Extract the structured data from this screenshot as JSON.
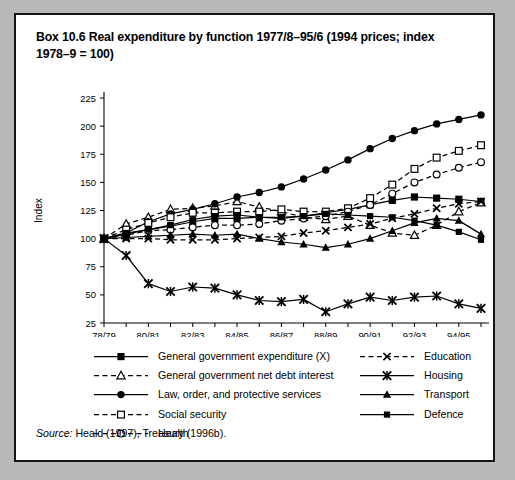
{
  "box": {
    "title": "Box 10.6  Real expenditure by function 1977/8–95/6 (1994 prices; index 1978–9 = 100)",
    "source_prefix": "Source:",
    "source_text": " Heald (1997), Treasury (1996b)."
  },
  "chart_data": {
    "type": "line",
    "title": "Real expenditure by function 1977/8–95/6 (1994 prices; index 1978–9 = 100)",
    "xlabel": "",
    "ylabel": "Index",
    "ylim": [
      25,
      225
    ],
    "yticks": [
      25,
      50,
      75,
      100,
      125,
      150,
      175,
      200,
      225
    ],
    "grid": false,
    "legend_position": "below",
    "x": [
      "78/79",
      "79/80",
      "80/81",
      "81/82",
      "82/83",
      "83/84",
      "84/85",
      "85/86",
      "86/87",
      "87/88",
      "88/89",
      "89/90",
      "90/91",
      "91/92",
      "92/93",
      "93/94",
      "94/95",
      "95/96"
    ],
    "xtick_labels": [
      "78/79",
      "80/81",
      "82/83",
      "84/85",
      "86/87",
      "88/89",
      "90/91",
      "92/93",
      "94/95"
    ],
    "xtick_indices": [
      0,
      2,
      4,
      6,
      8,
      10,
      12,
      14,
      16
    ],
    "series": [
      {
        "name": "General government expenditure (X)",
        "marker": "filled-square",
        "line": "solid",
        "values": [
          100,
          104,
          108,
          111,
          115,
          118,
          118,
          119,
          118,
          120,
          123,
          126,
          130,
          134,
          137,
          136,
          135,
          133
        ]
      },
      {
        "name": "General government net debt interest",
        "marker": "open-triangle",
        "line": "dashed",
        "values": [
          100,
          113,
          119,
          126,
          127,
          129,
          133,
          128,
          124,
          119,
          117,
          120,
          112,
          105,
          103,
          112,
          124,
          132
        ]
      },
      {
        "name": "Law, order, and protective services",
        "marker": "filled-circle",
        "line": "solid",
        "values": [
          100,
          105,
          115,
          122,
          126,
          131,
          137,
          141,
          146,
          153,
          161,
          170,
          180,
          189,
          196,
          202,
          206,
          210
        ]
      },
      {
        "name": "Social security",
        "marker": "open-square",
        "line": "dashed",
        "values": [
          100,
          108,
          114,
          119,
          123,
          123,
          124,
          124,
          126,
          124,
          124,
          127,
          136,
          148,
          162,
          172,
          178,
          183
        ]
      },
      {
        "name": "Health",
        "marker": "open-circle",
        "line": "dashed",
        "values": [
          100,
          103,
          107,
          108,
          110,
          112,
          112,
          113,
          116,
          118,
          120,
          124,
          130,
          140,
          150,
          157,
          163,
          168
        ]
      },
      {
        "name": "Education",
        "marker": "cross-x",
        "line": "dashed",
        "values": [
          100,
          100,
          100,
          99,
          99,
          99,
          100,
          101,
          102,
          105,
          107,
          110,
          113,
          118,
          122,
          127,
          131,
          133
        ]
      },
      {
        "name": "Housing",
        "marker": "star-x",
        "line": "solid",
        "values": [
          100,
          85,
          60,
          53,
          57,
          56,
          50,
          45,
          44,
          46,
          35,
          42,
          48,
          45,
          48,
          49,
          42,
          38
        ]
      },
      {
        "name": "Transport",
        "marker": "filled-triangle",
        "line": "solid",
        "values": [
          100,
          101,
          102,
          103,
          104,
          103,
          104,
          100,
          97,
          95,
          92,
          95,
          100,
          107,
          114,
          118,
          116,
          104
        ]
      },
      {
        "name": "Defence",
        "marker": "filled-square-sm",
        "line": "solid",
        "values": [
          100,
          105,
          108,
          112,
          117,
          120,
          121,
          119,
          119,
          120,
          122,
          121,
          120,
          119,
          116,
          112,
          106,
          99
        ]
      }
    ]
  },
  "legend": {
    "left_items": [
      {
        "label": "General government expenditure (X)",
        "marker": "filled-square",
        "line": "solid"
      },
      {
        "label": "General government net debt interest",
        "marker": "open-triangle",
        "line": "dashed"
      },
      {
        "label": "Law, order, and protective services",
        "marker": "filled-circle",
        "line": "solid"
      },
      {
        "label": "Social security",
        "marker": "open-square",
        "line": "dashed"
      },
      {
        "label": "Health",
        "marker": "open-circle",
        "line": "dashed"
      }
    ],
    "right_items": [
      {
        "label": "Education",
        "marker": "cross-x",
        "line": "dashed"
      },
      {
        "label": "Housing",
        "marker": "star-x",
        "line": "solid"
      },
      {
        "label": "Transport",
        "marker": "filled-triangle",
        "line": "solid"
      },
      {
        "label": "Defence",
        "marker": "filled-square-sm",
        "line": "solid"
      }
    ]
  },
  "colors": {
    "ink": "#000000",
    "paper": "#ffffff",
    "frame": "#141414",
    "backdrop": "#b9b9b9"
  }
}
